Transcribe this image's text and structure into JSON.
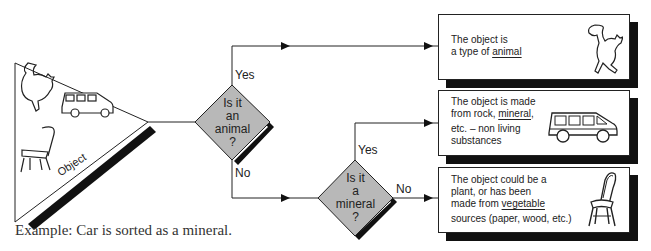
{
  "input": {
    "label": "Object",
    "icons": [
      "cat-icon",
      "car-icon",
      "chair-icon"
    ]
  },
  "decisions": [
    {
      "lines": [
        "Is it",
        "an",
        "animal",
        "?"
      ],
      "yes_label": "Yes",
      "no_label": "No"
    },
    {
      "lines": [
        "Is it",
        "a",
        "mineral",
        "?"
      ],
      "yes_label": "Yes",
      "no_label": "No"
    }
  ],
  "outcomes": [
    {
      "pre": "The object is",
      "pre2": "a type of ",
      "keyword": "animal",
      "post": "",
      "icon": "cat-icon"
    },
    {
      "line1": "The object is made",
      "line2_pre": "from rock, ",
      "keyword": "mineral",
      "line2_post": ",",
      "line3": "etc. – non living",
      "line4": "substances",
      "icon": "car-icon"
    },
    {
      "line1": "The object could be a",
      "line2": "plant, or has been",
      "line3_pre": "made from ",
      "keyword": "vegetable",
      "line4": "sources (paper, wood, etc.)",
      "icon": "chair-icon"
    }
  ],
  "caption": "Example: Car is sorted as a mineral.",
  "colors": {
    "diamond_fill": "#b8b8b8",
    "line": "#222222",
    "shadow": "#111111"
  }
}
